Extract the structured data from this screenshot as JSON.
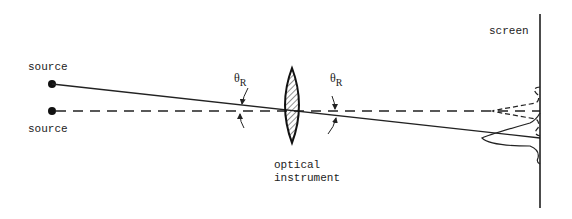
{
  "diagram": {
    "type": "optical-resolution-schematic",
    "labels": {
      "source_top": "source",
      "source_bottom": "source",
      "screen": "screen",
      "instrument_line1": "optical",
      "instrument_line2": "instrument",
      "angle_left": "θ",
      "angle_left_sub": "R",
      "angle_right": "θ",
      "angle_right_sub": "R"
    },
    "nodes": [
      {
        "id": "source-1",
        "label": "source",
        "kind": "point-source",
        "ray": "solid"
      },
      {
        "id": "source-2",
        "label": "source",
        "kind": "point-source",
        "ray": "dashed"
      },
      {
        "id": "lens",
        "label": "optical instrument",
        "kind": "converging-lens"
      },
      {
        "id": "screen",
        "label": "screen",
        "kind": "screen"
      }
    ],
    "edges": [
      {
        "from": "source-1",
        "to": "screen",
        "style": "solid",
        "via": "lens"
      },
      {
        "from": "source-2",
        "to": "screen",
        "style": "dashed",
        "via": "lens"
      }
    ],
    "annotations": [
      {
        "type": "angle",
        "label": "θR",
        "position": "left of lens"
      },
      {
        "type": "angle",
        "label": "θR",
        "position": "right of lens"
      },
      {
        "type": "intensity-pattern",
        "style": "solid",
        "position": "screen lower"
      },
      {
        "type": "intensity-pattern",
        "style": "dashed",
        "position": "screen upper"
      }
    ],
    "colors": {
      "ink": "#222222",
      "background": "#ffffff"
    }
  }
}
